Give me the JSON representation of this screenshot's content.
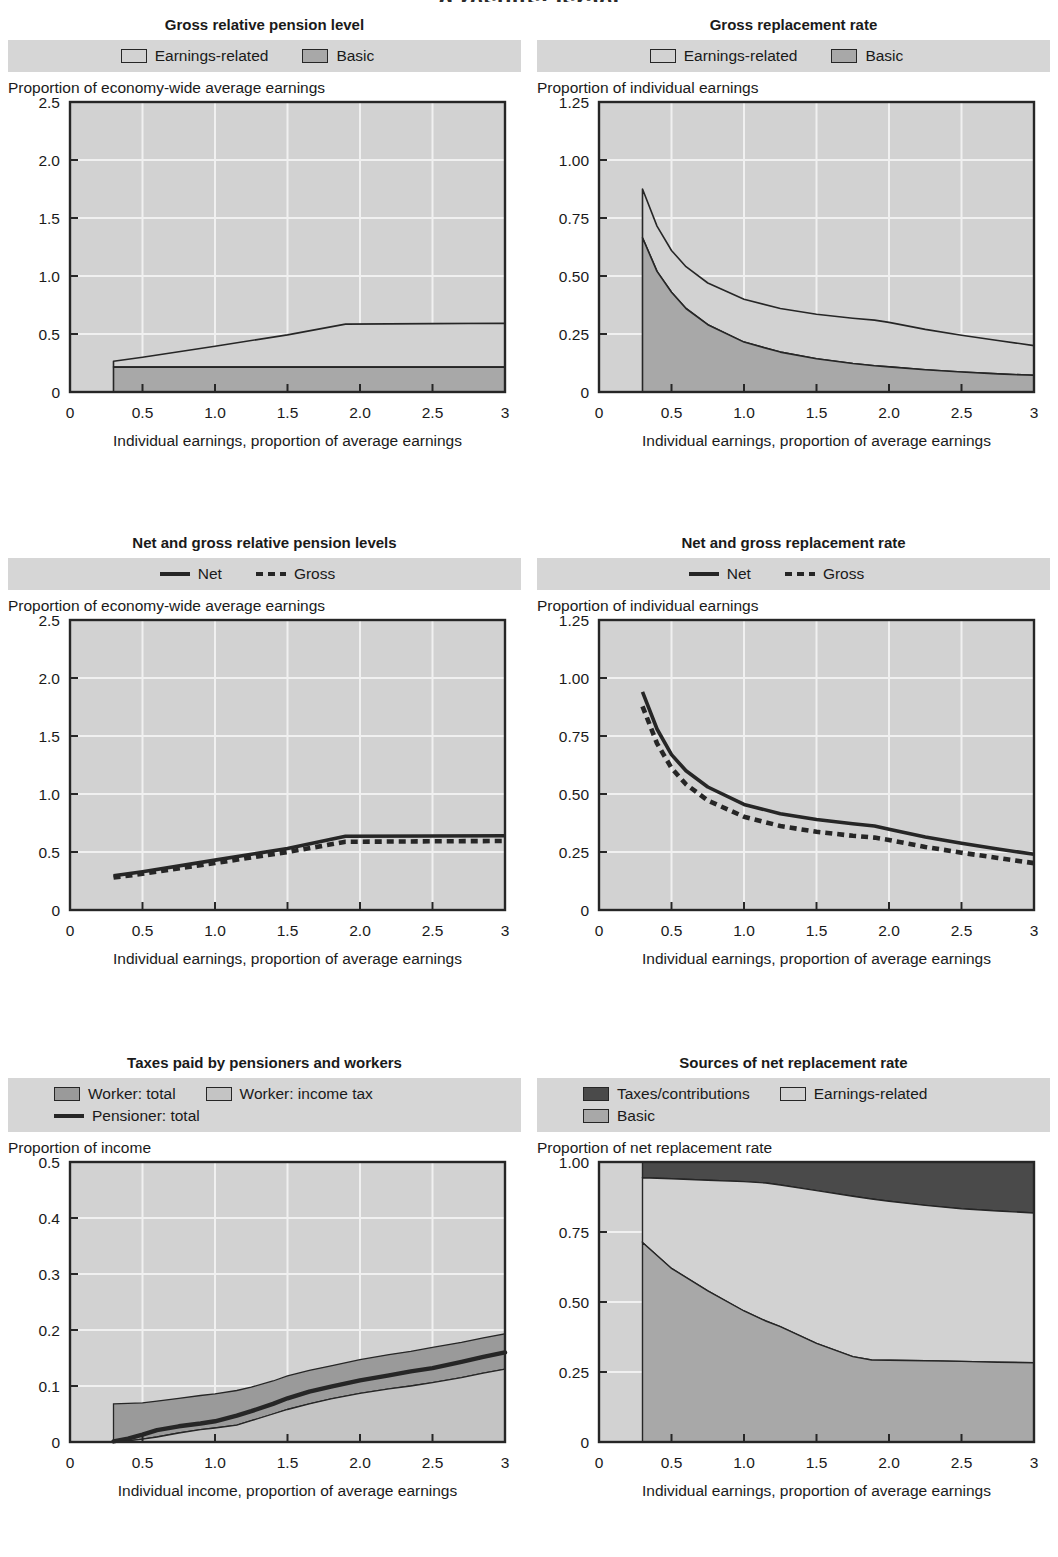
{
  "page": {
    "header_partial": "g results: Israel"
  },
  "colors": {
    "plot_bg": "#d2d2d2",
    "legend_bg": "#d6d6d6",
    "grid": "#f0f0f0",
    "axis": "#262626",
    "earnings_related": "#d2d2d2",
    "basic": "#a8a8a8",
    "taxes_contributions": "#4a4a4a",
    "worker_total": "#9a9a9a",
    "worker_income_tax": "#c4c4c4",
    "pensioner_line": "#262626"
  },
  "charts": [
    {
      "id": "gross-relative-pension-level",
      "title": "Gross relative pension level",
      "legend": [
        {
          "label": "Earnings-related",
          "swatch": "earnings_related",
          "type": "box"
        },
        {
          "label": "Basic",
          "swatch": "basic",
          "type": "box"
        }
      ],
      "ylabel": "Proportion of economy-wide average earnings",
      "xlabel": "Individual earnings, proportion of average earnings",
      "chart_data": {
        "type": "area",
        "title": "Gross relative pension level",
        "xlabel": "Individual earnings, proportion of average earnings",
        "ylabel": "Proportion of economy-wide average earnings",
        "xlim": [
          0,
          3
        ],
        "ylim": [
          0,
          2.5
        ],
        "xticks": [
          0,
          0.5,
          1.0,
          1.5,
          2.0,
          2.5,
          3
        ],
        "xticklabels": [
          "0",
          "0.5",
          "1.0",
          "1.5",
          "2.0",
          "2.5",
          "3"
        ],
        "yticks": [
          0,
          0.5,
          1.0,
          1.5,
          2.0,
          2.5
        ],
        "yticklabels": [
          "0",
          "0.5",
          "1.0",
          "1.5",
          "2.0",
          "2.5"
        ],
        "grid": true,
        "legend_position": "top",
        "x": [
          0.3,
          0.5,
          1.0,
          1.5,
          1.9,
          2.5,
          3.0
        ],
        "series": [
          {
            "name": "Basic",
            "stacked_base": true,
            "values": [
              0.215,
              0.215,
              0.215,
              0.215,
              0.215,
              0.215,
              0.215
            ]
          },
          {
            "name": "Earnings-related",
            "stacked_total": true,
            "values": [
              0.265,
              0.3,
              0.395,
              0.492,
              0.585,
              0.59,
              0.592
            ]
          }
        ]
      }
    },
    {
      "id": "gross-replacement-rate",
      "title": "Gross replacement rate",
      "legend": [
        {
          "label": "Earnings-related",
          "swatch": "earnings_related",
          "type": "box"
        },
        {
          "label": "Basic",
          "swatch": "basic",
          "type": "box"
        }
      ],
      "ylabel": "Proportion of individual earnings",
      "xlabel": "Individual earnings, proportion of average earnings",
      "chart_data": {
        "type": "area",
        "title": "Gross replacement rate",
        "xlabel": "Individual earnings, proportion of average earnings",
        "ylabel": "Proportion of individual earnings",
        "xlim": [
          0,
          3
        ],
        "ylim": [
          0,
          1.25
        ],
        "xticks": [
          0,
          0.5,
          1.0,
          1.5,
          2.0,
          2.5,
          3
        ],
        "xticklabels": [
          "0",
          "0.5",
          "1.0",
          "1.5",
          "2.0",
          "2.5",
          "3"
        ],
        "yticks": [
          0,
          0.25,
          0.5,
          0.75,
          1.0,
          1.25
        ],
        "yticklabels": [
          "0",
          "0.25",
          "0.50",
          "0.75",
          "1.00",
          "1.25"
        ],
        "grid": true,
        "legend_position": "top",
        "x": [
          0.3,
          0.4,
          0.5,
          0.6,
          0.75,
          1.0,
          1.25,
          1.5,
          1.75,
          1.9,
          2.0,
          2.25,
          2.5,
          2.75,
          3.0
        ],
        "series": [
          {
            "name": "Basic",
            "stacked_base": true,
            "values": [
              0.665,
              0.52,
              0.43,
              0.36,
              0.29,
              0.215,
              0.172,
              0.143,
              0.123,
              0.113,
              0.108,
              0.096,
              0.086,
              0.078,
              0.072
            ]
          },
          {
            "name": "Earnings-related",
            "stacked_total": true,
            "values": [
              0.875,
              0.715,
              0.61,
              0.54,
              0.47,
              0.4,
              0.36,
              0.335,
              0.318,
              0.31,
              0.3,
              0.27,
              0.245,
              0.222,
              0.2
            ]
          }
        ]
      }
    },
    {
      "id": "net-and-gross-relative-pension-levels",
      "title": "Net and gross relative pension levels",
      "legend": [
        {
          "label": "Net",
          "swatch": "pensioner_line",
          "type": "line"
        },
        {
          "label": "Gross",
          "swatch": "pensioner_line",
          "type": "dotted"
        }
      ],
      "ylabel": "Proportion of economy-wide average earnings",
      "xlabel": "Individual earnings, proportion of average earnings",
      "chart_data": {
        "type": "line",
        "title": "Net and gross relative pension levels",
        "xlabel": "Individual earnings, proportion of average earnings",
        "ylabel": "Proportion of economy-wide average earnings",
        "xlim": [
          0,
          3
        ],
        "ylim": [
          0,
          2.5
        ],
        "xticks": [
          0,
          0.5,
          1.0,
          1.5,
          2.0,
          2.5,
          3
        ],
        "xticklabels": [
          "0",
          "0.5",
          "1.0",
          "1.5",
          "2.0",
          "2.5",
          "3"
        ],
        "yticks": [
          0,
          0.5,
          1.0,
          1.5,
          2.0,
          2.5
        ],
        "yticklabels": [
          "0",
          "0.5",
          "1.0",
          "1.5",
          "2.0",
          "2.5"
        ],
        "grid": true,
        "legend_position": "top",
        "x": [
          0.3,
          0.5,
          1.0,
          1.5,
          1.9,
          2.5,
          3.0
        ],
        "series": [
          {
            "name": "Net",
            "style": "solid",
            "values": [
              0.295,
              0.33,
              0.43,
              0.53,
              0.635,
              0.638,
              0.64
            ]
          },
          {
            "name": "Gross",
            "style": "dotted",
            "values": [
              0.28,
              0.312,
              0.405,
              0.5,
              0.588,
              0.592,
              0.595
            ]
          }
        ]
      }
    },
    {
      "id": "net-and-gross-replacement-rate",
      "title": "Net and gross replacement rate",
      "legend": [
        {
          "label": "Net",
          "swatch": "pensioner_line",
          "type": "line"
        },
        {
          "label": "Gross",
          "swatch": "pensioner_line",
          "type": "dotted"
        }
      ],
      "ylabel": "Proportion of individual earnings",
      "xlabel": "Individual earnings, proportion of average earnings",
      "chart_data": {
        "type": "line",
        "title": "Net and gross replacement rate",
        "xlabel": "Individual earnings, proportion of average earnings",
        "ylabel": "Proportion of individual earnings",
        "xlim": [
          0,
          3
        ],
        "ylim": [
          0,
          1.25
        ],
        "xticks": [
          0,
          0.5,
          1.0,
          1.5,
          2.0,
          2.5,
          3
        ],
        "xticklabels": [
          "0",
          "0.5",
          "1.0",
          "1.5",
          "2.0",
          "2.5",
          "3"
        ],
        "yticks": [
          0,
          0.25,
          0.5,
          0.75,
          1.0,
          1.25
        ],
        "yticklabels": [
          "0",
          "0.25",
          "0.50",
          "0.75",
          "1.00",
          "1.25"
        ],
        "grid": true,
        "legend_position": "top",
        "x": [
          0.3,
          0.4,
          0.5,
          0.6,
          0.75,
          1.0,
          1.25,
          1.5,
          1.75,
          1.9,
          2.0,
          2.25,
          2.5,
          2.75,
          3.0
        ],
        "series": [
          {
            "name": "Net",
            "style": "solid",
            "values": [
              0.94,
              0.78,
              0.67,
              0.6,
              0.53,
              0.455,
              0.415,
              0.39,
              0.372,
              0.362,
              0.348,
              0.315,
              0.288,
              0.263,
              0.24
            ]
          },
          {
            "name": "Gross",
            "style": "dotted",
            "values": [
              0.878,
              0.718,
              0.612,
              0.542,
              0.472,
              0.402,
              0.362,
              0.337,
              0.32,
              0.312,
              0.302,
              0.272,
              0.247,
              0.224,
              0.202
            ]
          }
        ]
      }
    },
    {
      "id": "taxes-paid-by-pensioners-and-workers",
      "title": "Taxes paid by pensioners and workers",
      "legend": [
        {
          "label": "Worker: total",
          "swatch": "worker_total",
          "type": "box"
        },
        {
          "label": "Worker: income tax",
          "swatch": "worker_income_tax",
          "type": "box"
        },
        {
          "label": "Pensioner: total",
          "swatch": "pensioner_line",
          "type": "line"
        }
      ],
      "ylabel": "Proportion of income",
      "xlabel": "Individual income, proportion of average earnings",
      "chart_data": {
        "type": "area",
        "title": "Taxes paid by pensioners and workers",
        "xlabel": "Individual income, proportion of average earnings",
        "ylabel": "Proportion of income",
        "xlim": [
          0,
          3
        ],
        "ylim": [
          0,
          0.5
        ],
        "xticks": [
          0,
          0.5,
          1.0,
          1.5,
          2.0,
          2.5,
          3
        ],
        "xticklabels": [
          "0",
          "0.5",
          "1.0",
          "1.5",
          "2.0",
          "2.5",
          "3"
        ],
        "yticks": [
          0,
          0.1,
          0.2,
          0.3,
          0.4,
          0.5
        ],
        "yticklabels": [
          "0",
          "0.1",
          "0.2",
          "0.3",
          "0.4",
          "0.5"
        ],
        "grid": true,
        "legend_position": "top",
        "x": [
          0.3,
          0.4,
          0.5,
          0.6,
          0.75,
          0.9,
          1.0,
          1.15,
          1.25,
          1.4,
          1.5,
          1.65,
          1.8,
          2.0,
          2.2,
          2.35,
          2.5,
          2.7,
          2.85,
          3.0
        ],
        "series": [
          {
            "name": "Worker: total",
            "stacked_total": true,
            "values": [
              0.068,
              0.069,
              0.07,
              0.073,
              0.078,
              0.083,
              0.086,
              0.092,
              0.098,
              0.109,
              0.118,
              0.128,
              0.136,
              0.147,
              0.156,
              0.162,
              0.169,
              0.178,
              0.186,
              0.193
            ]
          },
          {
            "name": "Worker: income tax",
            "stacked_base": true,
            "values": [
              0.0,
              0.002,
              0.005,
              0.009,
              0.016,
              0.022,
              0.025,
              0.03,
              0.038,
              0.05,
              0.058,
              0.068,
              0.077,
              0.087,
              0.095,
              0.1,
              0.106,
              0.115,
              0.123,
              0.13
            ]
          },
          {
            "name": "Pensioner: total",
            "style": "solid",
            "values": [
              0.001,
              0.006,
              0.013,
              0.021,
              0.028,
              0.033,
              0.037,
              0.047,
              0.055,
              0.068,
              0.078,
              0.09,
              0.099,
              0.11,
              0.119,
              0.126,
              0.132,
              0.143,
              0.152,
              0.16
            ]
          }
        ]
      }
    },
    {
      "id": "sources-of-net-replacement-rate",
      "title": "Sources of net replacement rate",
      "legend": [
        {
          "label": "Taxes/contributions",
          "swatch": "taxes_contributions",
          "type": "box"
        },
        {
          "label": "Earnings-related",
          "swatch": "earnings_related",
          "type": "box"
        },
        {
          "label": "Basic",
          "swatch": "basic",
          "type": "box"
        }
      ],
      "ylabel": "Proportion of net replacement rate",
      "xlabel": "Individual earnings, proportion of average earnings",
      "chart_data": {
        "type": "area",
        "title": "Sources of net replacement rate",
        "xlabel": "Individual earnings, proportion of average earnings",
        "ylabel": "Proportion of net replacement rate",
        "xlim": [
          0,
          3
        ],
        "ylim": [
          0,
          1.0
        ],
        "xticks": [
          0,
          0.5,
          1.0,
          1.5,
          2.0,
          2.5,
          3
        ],
        "xticklabels": [
          "0",
          "0.5",
          "1.0",
          "1.5",
          "2.0",
          "2.5",
          "3"
        ],
        "yticks": [
          0,
          0.25,
          0.5,
          0.75,
          1.0
        ],
        "yticklabels": [
          "0",
          "0.25",
          "0.50",
          "0.75",
          "1.00"
        ],
        "grid": true,
        "legend_position": "top",
        "x": [
          0.3,
          0.5,
          0.75,
          1.0,
          1.15,
          1.25,
          1.5,
          1.75,
          1.88,
          2.0,
          2.25,
          2.5,
          2.75,
          3.0
        ],
        "series": [
          {
            "name": "Basic",
            "stacked_base": true,
            "values": [
              0.712,
              0.62,
              0.54,
              0.468,
              0.432,
              0.412,
              0.352,
              0.305,
              0.293,
              0.292,
              0.29,
              0.288,
              0.285,
              0.283
            ]
          },
          {
            "name": "Earnings-related",
            "stacked_total": true,
            "values": [
              0.944,
              0.94,
              0.935,
              0.93,
              0.925,
              0.918,
              0.898,
              0.878,
              0.868,
              0.86,
              0.845,
              0.833,
              0.825,
              0.818
            ]
          },
          {
            "name": "Taxes/contributions",
            "stacked_top": true,
            "values": [
              1.0,
              1.0,
              1.0,
              1.0,
              1.0,
              1.0,
              1.0,
              1.0,
              1.0,
              1.0,
              1.0,
              1.0,
              1.0,
              1.0
            ]
          }
        ]
      }
    }
  ]
}
